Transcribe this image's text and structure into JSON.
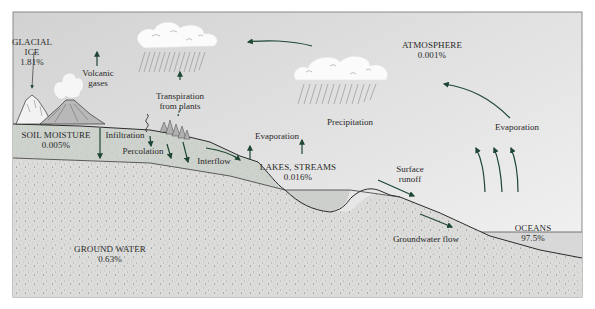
{
  "diagram": {
    "colors": {
      "sky_top": "#d4d4d4",
      "sky_bottom": "#f2f2f2",
      "soil": "#cfd3ce",
      "ground": "#dadbd8",
      "ocean": "#d6d6d6",
      "arrow": "#1e4634",
      "outline": "#2b2b2b",
      "cloud": "#ffffff",
      "text": "#2a2a2a"
    },
    "reservoirs": {
      "glacial_ice": {
        "name_line1": "GLACIAL",
        "name_line2": "ICE",
        "percent": "1.81%"
      },
      "atmosphere": {
        "name": "ATMOSPHERE",
        "percent": "0.001%"
      },
      "soil_moisture": {
        "name": "SOIL MOISTURE",
        "percent": "0.005%"
      },
      "lakes_streams": {
        "name": "LAKES, STREAMS",
        "percent": "0.016%"
      },
      "ground_water": {
        "name": "GROUND WATER",
        "percent": "0.63%"
      },
      "oceans": {
        "name": "OCEANS",
        "percent": "97.5%"
      }
    },
    "processes": {
      "volcanic_gases": {
        "line1": "Volcanic",
        "line2": "gases"
      },
      "transpiration": {
        "line1": "Transpiration",
        "line2": "from plants"
      },
      "precipitation": "Precipitation",
      "infiltration": "Infiltration",
      "percolation": "Percolation",
      "interflow": "Interflow",
      "evaporation_land": "Evaporation",
      "evaporation_ocean": "Evaporation",
      "surface_runoff": {
        "line1": "Surface",
        "line2": "runoff"
      },
      "groundwater_flow": "Groundwater flow"
    }
  }
}
